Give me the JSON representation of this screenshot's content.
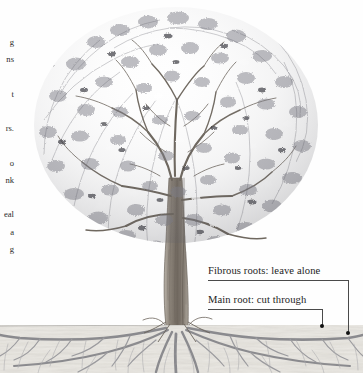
{
  "page": {
    "background": "#fefefe",
    "width": 363,
    "height": 373
  },
  "body_text_column": {
    "note": "right edges of a body-text column cropped off at the left margin",
    "line_fragments": [
      "g",
      "ns",
      "t",
      "rs.",
      "o",
      "nk",
      "eal",
      "a",
      "g"
    ]
  },
  "illustration": {
    "subject": "deciduous tree with exposed root system in cross-section",
    "style": "pen-and-ink botanical line drawing",
    "ground_line_y": 325,
    "ink_color": "#6e6e72",
    "trunk_color": "#8a8179",
    "soil_color": "#e9e6e0"
  },
  "callouts": [
    {
      "id": "fibrous",
      "label": "Fibrous roots: leave alone",
      "target_x": 348,
      "target_y": 333
    },
    {
      "id": "main",
      "label": "Main root: cut through",
      "target_x": 322,
      "target_y": 325
    }
  ]
}
